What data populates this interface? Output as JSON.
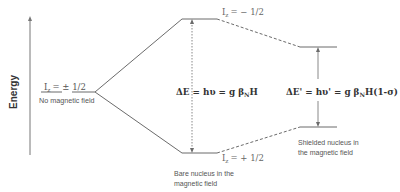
{
  "diagram": {
    "axis_label": "Energy",
    "left_level": {
      "spin_label_main": "I",
      "spin_label_sub": "z",
      "spin_label_value": "= ± 1/2",
      "caption": "No magnetic field"
    },
    "upper_level": {
      "spin_label_main": "I",
      "spin_label_sub": "z",
      "spin_label_value": "= − 1/2"
    },
    "lower_level": {
      "spin_label_main": "I",
      "spin_label_sub": "z",
      "spin_label_value": "= + 1/2"
    },
    "bare_nucleus": {
      "caption_line1": "Bare nucleus in the",
      "caption_line2": "magnetic field",
      "equation_prefix": "ΔE = hυ = g β",
      "equation_sub": "N",
      "equation_suffix": "H"
    },
    "shielded_nucleus": {
      "caption_line1": "Shielded nucleus in",
      "caption_line2": "the magnetic field",
      "equation_prefix": "ΔE' = hυ' = g β",
      "equation_sub": "N",
      "equation_suffix": "H(1-σ)"
    },
    "colors": {
      "line": "#6b6b6b",
      "text": "#555555",
      "equation": "#333333"
    }
  }
}
